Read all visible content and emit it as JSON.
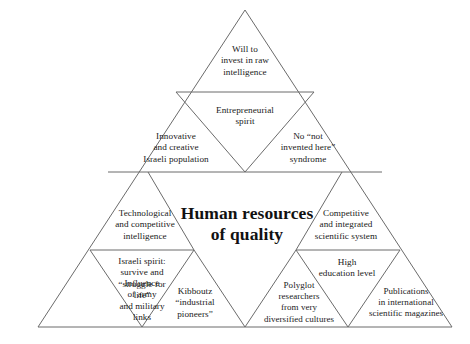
{
  "diagram": {
    "type": "pyramid-triangle-matrix",
    "title": "Human resources\nof quality",
    "geometry": {
      "apex": {
        "x": 245,
        "y": 10
      },
      "base_left": {
        "x": 38,
        "y": 327
      },
      "base_right": {
        "x": 452,
        "y": 327
      },
      "row_divider_y": [
        92,
        172,
        250,
        327
      ],
      "rows": 4
    },
    "colors": {
      "background": "#ffffff",
      "stroke": "#6b6b6b",
      "text": "#1a1a1a",
      "title_text": "#111111"
    },
    "cells": [
      {
        "id": "will-to-invest",
        "row": 1,
        "orientation": "upright",
        "label": "Will to\ninvest in raw\nintelligence"
      },
      {
        "id": "innovative-creative-population",
        "row": 2,
        "orientation": "upright",
        "label": "Innovative\nand creative\nIsraeli population"
      },
      {
        "id": "entrepreneurial-spirit",
        "row": 2,
        "orientation": "inverted",
        "label": "Entrepreneurial\nspirit"
      },
      {
        "id": "no-not-invented-here",
        "row": 2,
        "orientation": "upright",
        "label": "No “not\ninvented here”\nsyndrome"
      },
      {
        "id": "technological-competitive-intelligence",
        "row": 3,
        "orientation": "upright",
        "label": "Technological\nand competitive\nintelligence"
      },
      {
        "id": "competitive-integrated-scientific-system",
        "row": 3,
        "orientation": "upright",
        "label": "Competitive\nand integrated\nscientific system"
      },
      {
        "id": "influence-of-army",
        "row": 4,
        "orientation": "upright",
        "label": "Influence\nof army\nand military\nlinks"
      },
      {
        "id": "israeli-spirit",
        "row": 4,
        "orientation": "inverted",
        "label": "Israeli spirit:\nsurvive and\n“struggle for\nlife”"
      },
      {
        "id": "kibboutz-industrial-pioneers",
        "row": 4,
        "orientation": "upright",
        "label": "Kibboutz\n“industrial\npioneers”"
      },
      {
        "id": "high-education-level",
        "row": 4,
        "orientation": "inverted",
        "label": "High\neducation level"
      },
      {
        "id": "polyglot-researchers",
        "row": 4,
        "orientation": "upright",
        "label": "Polyglot\nresearchers\nfrom very\ndiversified cultures"
      },
      {
        "id": "publications-international",
        "row": 4,
        "orientation": "upright",
        "label": "Publications\nin international\nscientific magazines"
      }
    ]
  }
}
